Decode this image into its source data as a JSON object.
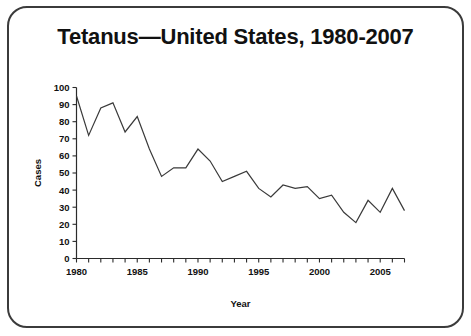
{
  "slide": {
    "title": "Tetanus—United States, 1980-2007",
    "border_color": "#3b3b3b",
    "background_color": "#ffffff"
  },
  "chart_data": {
    "type": "line",
    "title": "Tetanus—United States, 1980-2007",
    "xlabel": "Year",
    "ylabel": "Cases",
    "xlim": [
      1980,
      2007
    ],
    "ylim": [
      0,
      100
    ],
    "grid": false,
    "legend": false,
    "line_color": "#3a3a3a",
    "y_ticks": [
      0,
      10,
      20,
      30,
      40,
      50,
      60,
      70,
      80,
      90,
      100
    ],
    "y_tick_labels": [
      "0",
      "10",
      "20",
      "30",
      "40",
      "50",
      "60",
      "70",
      "80",
      "90",
      "100"
    ],
    "x_tick_labels": [
      "1980",
      "1985",
      "1990",
      "1995",
      "2000",
      "2005"
    ],
    "x_tick_label_values": [
      1980,
      1985,
      1990,
      1995,
      2000,
      2005
    ],
    "x_minor_tick_interval": 1,
    "x": [
      1980,
      1981,
      1982,
      1983,
      1984,
      1985,
      1986,
      1987,
      1988,
      1989,
      1990,
      1991,
      1992,
      1993,
      1994,
      1995,
      1996,
      1997,
      1998,
      1999,
      2000,
      2001,
      2002,
      2003,
      2004,
      2005,
      2006,
      2007
    ],
    "series": [
      {
        "name": "Cases",
        "values": [
          95,
          72,
          88,
          91,
          74,
          83,
          64,
          48,
          53,
          53,
          64,
          57,
          45,
          48,
          51,
          41,
          36,
          43,
          41,
          42,
          35,
          37,
          27,
          21,
          34,
          27,
          41,
          28
        ]
      }
    ]
  }
}
